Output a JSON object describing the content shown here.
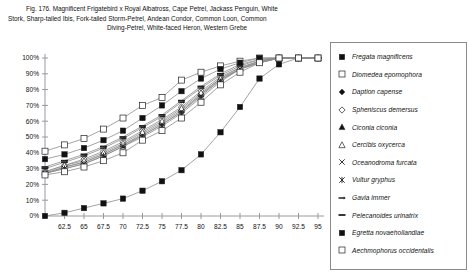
{
  "caption": {
    "line1": "Fig. 176.  Magnificent Frigatebird x Royal Albatross, Cape Petrel, Jackass Penguin, White",
    "line2": "Stork, Sharp-tailed Ibis, Fork-tailed Storm-Petrel, Andean Condor, Common Loon, Common",
    "line3": "Diving-Petrel, White-faced Heron, Western Grebe"
  },
  "colors": {
    "axis": "#9a9a9a",
    "line": "#8d8d8d",
    "marker_fill": "#111111",
    "marker_open": "#ffffff",
    "marker_edge": "#222222",
    "legend_border": "#8a8a8a",
    "text": "#111111"
  },
  "chart_data": {
    "type": "line",
    "title": "",
    "xlabel": "",
    "ylabel": "",
    "xlim": [
      60,
      95
    ],
    "ylim": [
      0,
      1.0
    ],
    "grid": false,
    "legend_position": "right",
    "x": [
      60,
      62.5,
      65,
      67.5,
      70,
      72.5,
      75,
      77.5,
      80,
      82.5,
      85,
      87.5,
      90,
      92.5,
      95
    ],
    "xtick_labels": [
      "",
      "62.5",
      "65",
      "67.5",
      "70",
      "72.5",
      "75",
      "77.5",
      "80",
      "82.5",
      "85",
      "87.5",
      "90",
      "92.5",
      "95"
    ],
    "ytick_labels": [
      "0%",
      "10%",
      "20%",
      "30%",
      "40%",
      "50%",
      "60%",
      "70%",
      "80%",
      "90%",
      "100%"
    ],
    "ytick_values": [
      0,
      10,
      20,
      30,
      40,
      50,
      60,
      70,
      80,
      90,
      100
    ],
    "series": [
      {
        "name": "Fregata magnificens",
        "marker": "filled-square",
        "values": [
          0,
          2,
          5,
          8,
          11,
          16,
          22,
          29,
          39,
          53,
          69,
          87,
          96,
          100,
          100
        ]
      },
      {
        "name": "Diomedea epomophora",
        "marker": "open-square",
        "values": [
          41,
          45,
          49,
          55,
          62,
          70,
          75,
          86,
          91,
          95,
          98,
          100,
          100,
          100,
          100
        ]
      },
      {
        "name": "Daption capense",
        "marker": "filled-diamond",
        "values": [
          27,
          31,
          34,
          39,
          45,
          51,
          58,
          66,
          77,
          86,
          93,
          97,
          100,
          100,
          100
        ]
      },
      {
        "name": "Spheniscus demersus",
        "marker": "open-diamond",
        "values": [
          28,
          32,
          36,
          41,
          47,
          54,
          61,
          69,
          79,
          88,
          94,
          98,
          100,
          100,
          100
        ]
      },
      {
        "name": "Ciconia ciconia",
        "marker": "filled-triangle",
        "values": [
          27,
          31,
          34,
          39,
          45,
          52,
          59,
          67,
          77,
          87,
          93,
          98,
          100,
          100,
          100
        ]
      },
      {
        "name": "Cercibis oxycerca",
        "marker": "open-triangle",
        "values": [
          28,
          32,
          35,
          40,
          46,
          53,
          60,
          68,
          78,
          87,
          94,
          98,
          100,
          100,
          100
        ]
      },
      {
        "name": "Oceanodroma furcata",
        "marker": "x-cross",
        "values": [
          27,
          30,
          33,
          38,
          44,
          51,
          58,
          66,
          76,
          86,
          93,
          97,
          100,
          100,
          100
        ]
      },
      {
        "name": "Vultur gryphus",
        "marker": "star-cross",
        "values": [
          27,
          30,
          33,
          38,
          44,
          50,
          57,
          65,
          75,
          85,
          93,
          97,
          100,
          100,
          100
        ]
      },
      {
        "name": "Gavia immer",
        "marker": "dash-arrow",
        "values": [
          30,
          34,
          38,
          43,
          49,
          56,
          63,
          72,
          81,
          89,
          95,
          99,
          100,
          100,
          100
        ]
      },
      {
        "name": "Pelecanoides urinatrix",
        "marker": "dash",
        "values": [
          31,
          35,
          39,
          44,
          50,
          57,
          64,
          73,
          82,
          90,
          96,
          99,
          100,
          100,
          100
        ]
      },
      {
        "name": "Egretta novaehollandiae",
        "marker": "filled-square",
        "values": [
          36,
          39,
          43,
          48,
          54,
          62,
          70,
          79,
          87,
          93,
          97,
          100,
          100,
          100,
          100
        ]
      },
      {
        "name": "Aechmophorus occidentalis",
        "marker": "open-square",
        "values": [
          26,
          28,
          31,
          35,
          40,
          48,
          54,
          62,
          72,
          83,
          91,
          97,
          100,
          100,
          100
        ]
      }
    ]
  }
}
